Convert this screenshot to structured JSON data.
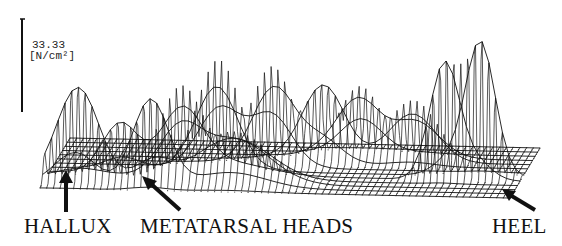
{
  "chart_data": {
    "type": "surface-3d-wireframe",
    "title": "",
    "zlabel_value": "33.33",
    "zlabel_unit": "[N/cm²]",
    "annotations": [
      {
        "label": "HALLUX",
        "arrow": "up"
      },
      {
        "label": "METATARSAL HEADS",
        "arrow": "up-left"
      },
      {
        "label": "HEEL",
        "arrow": "up-left"
      }
    ],
    "peaks": [
      {
        "region": "hallux",
        "relative_height": 0.78
      },
      {
        "region": "toe-2",
        "relative_height": 0.55
      },
      {
        "region": "metatarsal-1",
        "relative_height": 0.6
      },
      {
        "region": "metatarsal-2",
        "relative_height": 0.62
      },
      {
        "region": "metatarsal-3",
        "relative_height": 0.72
      },
      {
        "region": "metatarsal-4",
        "relative_height": 0.68
      },
      {
        "region": "metatarsal-5",
        "relative_height": 0.5
      },
      {
        "region": "midfoot-lateral",
        "relative_height": 0.45
      },
      {
        "region": "heel-medial",
        "relative_height": 0.88
      },
      {
        "region": "heel-lateral",
        "relative_height": 1.0
      }
    ],
    "zlim": [
      0,
      33.33
    ]
  },
  "labels": {
    "scale_value": "33.33",
    "scale_unit": "[N/cm²]",
    "hallux": "HALLUX",
    "metatarsal": "METATARSAL HEADS",
    "heel": "HEEL"
  }
}
